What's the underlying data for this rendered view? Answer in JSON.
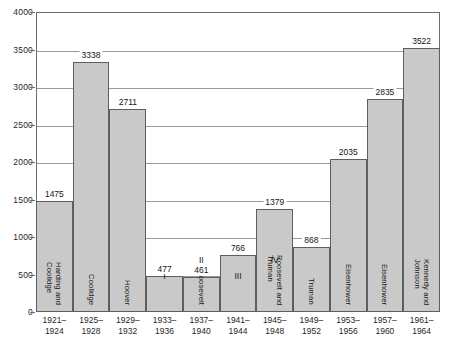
{
  "chart_data": {
    "type": "bar",
    "title": "",
    "subtitle": "",
    "xlabel": "",
    "ylabel": "",
    "ylim": [
      0,
      4000
    ],
    "y_ticks": [
      0,
      500,
      1000,
      1500,
      2000,
      2500,
      3000,
      3500,
      4000
    ],
    "grid": true,
    "legend": "none",
    "categories": [
      "1921–\n1924",
      "1925–\n1928",
      "1929–\n1932",
      "1933–\n1936",
      "1937–\n1940",
      "1941–\n1944",
      "1945–\n1948",
      "1949–\n1952",
      "1953–\n1956",
      "1957–\n1960",
      "1961–\n1964"
    ],
    "values": [
      1475,
      3338,
      2711,
      477,
      461,
      766,
      1379,
      868,
      2035,
      2835,
      3522
    ],
    "bar_color": "#c9c9c9",
    "bar_border_color": "#5e5e5e",
    "axis_color": "#6e6e6e",
    "gridline_color": "#9a9a9a",
    "bars": [
      {
        "value": 1475,
        "value_label": "1475",
        "term_label": "1921–",
        "term_label2": "1924",
        "roman": "",
        "name_lines": [
          "Harding and",
          "Coolidge"
        ]
      },
      {
        "value": 3338,
        "value_label": "3338",
        "term_label": "1925–",
        "term_label2": "1928",
        "roman": "",
        "name_lines": [
          "Coolidge"
        ]
      },
      {
        "value": 2711,
        "value_label": "2711",
        "term_label": "1929–",
        "term_label2": "1932",
        "roman": "",
        "name_lines": [
          "Hoover"
        ]
      },
      {
        "value": 477,
        "value_label": "477",
        "term_label": "1933–",
        "term_label2": "1936",
        "roman": "I",
        "name_lines": []
      },
      {
        "value": 461,
        "value_label": "461",
        "term_label": "1937–",
        "term_label2": "1940",
        "roman": "II",
        "name_lines": [
          "Roosevelt"
        ]
      },
      {
        "value": 766,
        "value_label": "766",
        "term_label": "1941–",
        "term_label2": "1944",
        "roman": "III",
        "name_lines": []
      },
      {
        "value": 1379,
        "value_label": "1379",
        "term_label": "1945–",
        "term_label2": "1948",
        "roman": "IV",
        "name_lines": [
          "Roosevelt and",
          "Truman"
        ]
      },
      {
        "value": 868,
        "value_label": "868",
        "term_label": "1949–",
        "term_label2": "1952",
        "roman": "",
        "name_lines": [
          "Truman"
        ]
      },
      {
        "value": 2035,
        "value_label": "2035",
        "term_label": "1953–",
        "term_label2": "1956",
        "roman": "",
        "name_lines": [
          "Eisenhower"
        ]
      },
      {
        "value": 2835,
        "value_label": "2835",
        "term_label": "1957–",
        "term_label2": "1960",
        "roman": "",
        "name_lines": [
          "Eisenhower"
        ]
      },
      {
        "value": 3522,
        "value_label": "3522",
        "term_label": "1961–",
        "term_label2": "1964",
        "roman": "",
        "name_lines": [
          "Kennedy and",
          "Johnson"
        ]
      }
    ]
  },
  "axis": {
    "y_tick_labels": [
      "4000",
      "3500",
      "3000",
      "2500",
      "2000",
      "1500",
      "1000",
      "500",
      "0"
    ]
  }
}
